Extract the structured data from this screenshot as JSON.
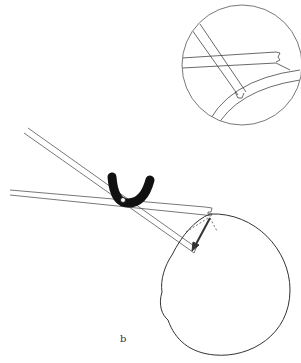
{
  "figure": {
    "panel_label": "b",
    "colors": {
      "line": "#333333",
      "fill_black": "#111111",
      "background": "#ffffff"
    },
    "elements": [
      "inset-magnified-circle",
      "instrument-shaft-upper",
      "instrument-shaft-lower",
      "u-shaped-fulcrum",
      "eye-globe-outline",
      "force-arrows"
    ]
  }
}
